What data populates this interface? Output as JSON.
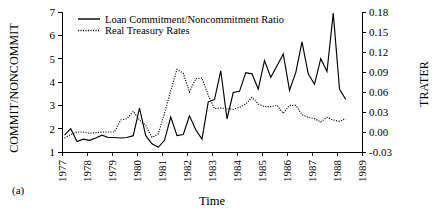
{
  "figure": {
    "panel_label": "(a)",
    "background": "#ffffff",
    "ink": "#000000"
  },
  "chart_data": {
    "type": "line",
    "title": "",
    "xlabel": "Time",
    "ylabel": "COMMIT/NONCOMMIT",
    "y2label": "TRATER",
    "grid": false,
    "legend_position": "top-left-inside",
    "xlim": [
      1977,
      1989
    ],
    "ylim": [
      1,
      7
    ],
    "y2lim": [
      -0.03,
      0.18
    ],
    "xticks": [
      "1977",
      "1978",
      "1979",
      "1980",
      "1981",
      "1982",
      "1983",
      "1984",
      "1985",
      "1986",
      "1987",
      "1988",
      "1989"
    ],
    "yticks": [
      "1",
      "2",
      "3",
      "4",
      "5",
      "6",
      "7"
    ],
    "y2ticks": [
      "-0.03",
      "0.00",
      "0.03",
      "0.06",
      "0.09",
      "0.12",
      "0.15",
      "0.18"
    ],
    "series": [
      {
        "name": "Loan Commitment/Noncommitment Ratio",
        "style": "solid",
        "axis": "left",
        "x": [
          1977.1,
          1977.35,
          1977.6,
          1977.85,
          1978.1,
          1978.35,
          1978.6,
          1978.85,
          1979.1,
          1979.35,
          1979.6,
          1979.85,
          1980.1,
          1980.35,
          1980.6,
          1980.85,
          1981.1,
          1981.35,
          1981.6,
          1981.85,
          1982.1,
          1982.35,
          1982.6,
          1982.85,
          1983.1,
          1983.35,
          1983.6,
          1983.85,
          1984.1,
          1984.35,
          1984.6,
          1984.85,
          1985.1,
          1985.35,
          1985.6,
          1985.85,
          1986.1,
          1986.35,
          1986.6,
          1986.85,
          1987.1,
          1987.35,
          1987.6,
          1987.85,
          1988.1,
          1988.35
        ],
        "values": [
          1.72,
          2.0,
          1.45,
          1.55,
          1.5,
          1.6,
          1.72,
          1.62,
          1.62,
          1.6,
          1.62,
          1.7,
          2.88,
          1.7,
          1.35,
          1.2,
          1.5,
          2.5,
          1.7,
          1.75,
          2.55,
          1.95,
          1.55,
          3.15,
          3.25,
          4.48,
          2.42,
          3.55,
          3.6,
          4.4,
          4.35,
          3.7,
          4.92,
          4.2,
          4.7,
          5.2,
          3.65,
          4.4,
          5.72,
          4.35,
          3.9,
          5.0,
          4.45,
          6.95,
          3.7,
          3.25
        ]
      },
      {
        "name": "Real Treasury Rates",
        "style": "dotted",
        "axis": "right",
        "x": [
          1977.1,
          1977.35,
          1977.6,
          1977.85,
          1978.1,
          1978.35,
          1978.6,
          1978.85,
          1979.1,
          1979.35,
          1979.6,
          1979.85,
          1980.1,
          1980.35,
          1980.6,
          1980.85,
          1981.1,
          1981.35,
          1981.6,
          1981.85,
          1982.1,
          1982.35,
          1982.6,
          1982.85,
          1983.1,
          1983.35,
          1983.6,
          1983.85,
          1984.1,
          1984.35,
          1984.6,
          1984.85,
          1985.1,
          1985.35,
          1985.6,
          1985.85,
          1986.1,
          1986.35,
          1986.6,
          1986.85,
          1987.1,
          1987.35,
          1987.6,
          1987.85,
          1988.1,
          1988.35
        ],
        "values": [
          -0.009,
          -0.004,
          0.0,
          0.0,
          -0.002,
          -0.001,
          0.0,
          0.0,
          0.0,
          0.018,
          0.02,
          0.031,
          0.018,
          0.01,
          -0.008,
          -0.003,
          0.028,
          0.062,
          0.094,
          0.088,
          0.06,
          0.08,
          0.081,
          0.055,
          0.035,
          0.036,
          0.035,
          0.034,
          0.037,
          0.042,
          0.052,
          0.042,
          0.038,
          0.038,
          0.04,
          0.028,
          0.04,
          0.04,
          0.026,
          0.022,
          0.02,
          0.015,
          0.022,
          0.018,
          0.016,
          0.02
        ]
      }
    ],
    "legend": [
      {
        "label": "Loan Commitment/Noncommitment Ratio",
        "style": "solid"
      },
      {
        "label": "Real Treasury Rates",
        "style": "dotted"
      }
    ]
  }
}
